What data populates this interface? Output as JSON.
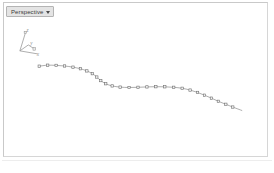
{
  "viewport": {
    "name": "3d-viewport",
    "background_color": "#ffffff",
    "border_color": "#c9c9c9",
    "view_label": "Perspective",
    "view_caret_icon": "chevron-down-icon",
    "view_options": [
      "Perspective",
      "Top",
      "Front",
      "Right",
      "User"
    ]
  },
  "axis_gizmo": {
    "name": "axis-gizmo",
    "labels": {
      "z": "z",
      "y": "y",
      "x": "x"
    },
    "color": "#9a9a9a"
  },
  "caption": {
    "text": ""
  },
  "chart_data": {
    "type": "line",
    "title": "",
    "xlabel": "x",
    "ylabel": "z",
    "legend": [],
    "grid": false,
    "xlim": [
      0,
      274
    ],
    "ylim": [
      173,
      0
    ],
    "marker": "square",
    "marker_size": 2.4,
    "line_color": "#8a8a8a",
    "marker_fill": "#f2f2f2",
    "marker_stroke": "#6f6f6f",
    "series": [
      {
        "name": "profile-curve",
        "points": [
          [
            39.5,
            67.0
          ],
          [
            48.0,
            66.0
          ],
          [
            56.5,
            66.2
          ],
          [
            65.0,
            66.8
          ],
          [
            73.5,
            68.0
          ],
          [
            81.0,
            69.6
          ],
          [
            87.5,
            71.8
          ],
          [
            93.0,
            74.6
          ],
          [
            97.5,
            78.0
          ],
          [
            101.5,
            81.6
          ],
          [
            106.5,
            84.8
          ],
          [
            113.0,
            87.0
          ],
          [
            121.0,
            88.2
          ],
          [
            130.0,
            88.6
          ],
          [
            139.0,
            88.4
          ],
          [
            148.0,
            88.0
          ],
          [
            157.0,
            87.8
          ],
          [
            166.0,
            87.9
          ],
          [
            175.0,
            88.4
          ],
          [
            183.5,
            89.4
          ],
          [
            191.5,
            91.2
          ],
          [
            199.0,
            93.6
          ],
          [
            206.0,
            96.4
          ],
          [
            213.0,
            99.4
          ],
          [
            220.0,
            102.6
          ],
          [
            227.5,
            105.6
          ],
          [
            234.5,
            108.4
          ]
        ],
        "tail_end": [
          244.0,
          112.0
        ]
      }
    ]
  }
}
